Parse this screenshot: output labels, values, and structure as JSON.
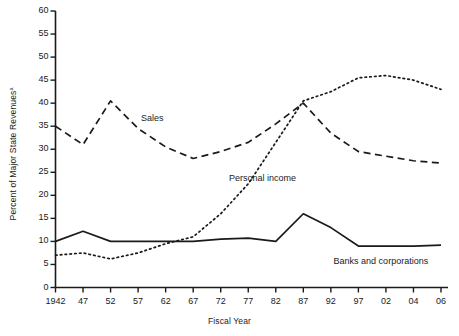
{
  "chart_data": {
    "type": "line",
    "title": "",
    "xlabel": "Fiscal Year",
    "ylabel": "Percent of Major State Revenues",
    "ylabel_superscript": "a",
    "xlim": [
      0,
      14
    ],
    "ylim": [
      0,
      60
    ],
    "y_ticks": [
      0,
      5,
      10,
      15,
      20,
      25,
      30,
      35,
      40,
      45,
      50,
      55,
      60
    ],
    "grid": false,
    "legend": "inline-labels",
    "categories": [
      "1942",
      "47",
      "52",
      "57",
      "62",
      "67",
      "72",
      "77",
      "82",
      "87",
      "92",
      "97",
      "02",
      "04",
      "06"
    ],
    "series": [
      {
        "name": "Sales",
        "style": "dashed",
        "color": "#1a1a1a",
        "label_text": "Sales",
        "values": [
          35.0,
          31.0,
          40.5,
          34.5,
          30.5,
          28.0,
          29.5,
          31.5,
          35.5,
          40.0,
          33.5,
          29.5,
          28.5,
          27.5,
          27.0
        ]
      },
      {
        "name": "Personal income",
        "style": "dotted",
        "color": "#1a1a1a",
        "label_text": "Personal income",
        "values": [
          7.0,
          7.5,
          6.2,
          7.5,
          9.5,
          11.0,
          16.0,
          22.5,
          31.5,
          40.5,
          42.5,
          45.5,
          46.0,
          45.0,
          43.0
        ]
      },
      {
        "name": "Banks and corporations",
        "style": "solid",
        "color": "#1a1a1a",
        "label_text": "Banks and corporations",
        "values": [
          10.0,
          12.2,
          10.0,
          10.0,
          10.0,
          10.0,
          10.5,
          10.7,
          10.0,
          16.0,
          13.0,
          9.0,
          9.0,
          9.0,
          9.2
        ]
      }
    ],
    "annotations": [
      {
        "text": "Sales",
        "x_index": 3.1,
        "y_value": 36.5
      },
      {
        "text": "Personal income",
        "x_index": 6.3,
        "y_value": 23.5
      },
      {
        "text": "Banks and corporations",
        "x_index": 10.1,
        "y_value": 5.5
      }
    ]
  }
}
